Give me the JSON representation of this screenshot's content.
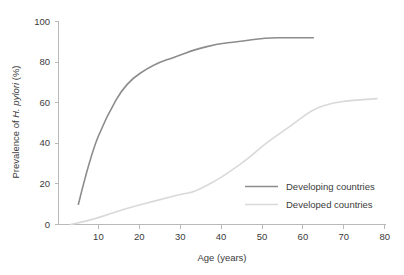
{
  "chart_data": {
    "type": "line",
    "title": "",
    "xlabel": "Age (years)",
    "ylabel_prefix": "Prevalence of ",
    "ylabel_italic": "H. pylori",
    "ylabel_suffix": " (%)",
    "ylabel_full": "Prevalence of H. pylori (%)",
    "xlim": [
      0,
      82
    ],
    "ylim": [
      0,
      100
    ],
    "xticks": [
      10,
      20,
      30,
      40,
      50,
      60,
      70,
      80
    ],
    "xtick_labels": [
      "10",
      "20",
      "30",
      "40",
      "50",
      "60",
      "70",
      "80"
    ],
    "yticks": [
      0,
      20,
      40,
      60,
      80,
      100
    ],
    "ytick_labels": [
      "0",
      "20",
      "40",
      "60",
      "80",
      "100"
    ],
    "grid": false,
    "legend_position": "lower-right-inside",
    "series": [
      {
        "name": "Developing countries",
        "color": "#8c8c8c",
        "x": [
          5,
          8,
          12,
          17,
          24,
          30,
          34,
          40,
          45,
          52,
          58,
          64
        ],
        "values": [
          10,
          34,
          53,
          70,
          79,
          83,
          86,
          89,
          90,
          92,
          92,
          92
        ]
      },
      {
        "name": "Developed countries",
        "color": "#d9d9d9",
        "x": [
          3,
          8,
          14,
          19,
          23,
          27,
          31,
          34,
          39,
          43,
          48,
          52,
          58,
          64,
          69,
          73,
          80
        ],
        "values": [
          0,
          2,
          6,
          9,
          11,
          13,
          15,
          16,
          21,
          26,
          33,
          40,
          48,
          57,
          60,
          61,
          62
        ]
      }
    ]
  },
  "legend": {
    "entries": [
      {
        "label": "Developing countries",
        "color": "#8c8c8c"
      },
      {
        "label": "Developed countries",
        "color": "#d9d9d9"
      }
    ]
  },
  "axes": {
    "x_title": "Age (years)",
    "y_title_prefix": "Prevalence of ",
    "y_title_italic": "H. pylori",
    "y_title_suffix": " (%)"
  },
  "colors": {
    "background": "#ffffff",
    "axis": "#b9b9b9",
    "text": "#3b3b3b",
    "developing": "#8c8c8c",
    "developed": "#d9d9d9"
  }
}
